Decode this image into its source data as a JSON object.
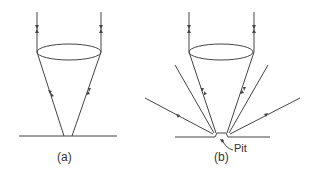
{
  "figure": {
    "panels": [
      {
        "id": "a",
        "label": "(a)"
      },
      {
        "id": "b",
        "label": "(b)",
        "annotation": "Pit"
      }
    ],
    "colors": {
      "line": "#444444",
      "background": "#ffffff"
    }
  }
}
